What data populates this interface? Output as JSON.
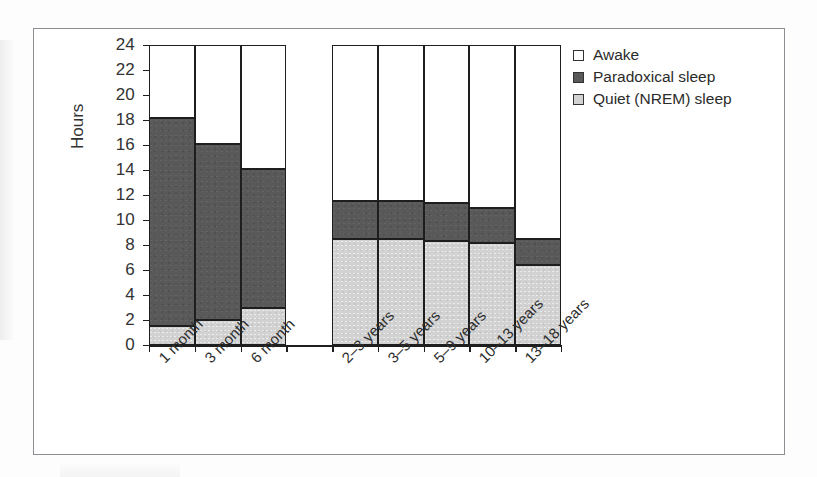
{
  "figure": {
    "background": "#ffffff",
    "frame_color": "#8d8d93"
  },
  "axis": {
    "y_title": "Hours",
    "y_ticks": [
      "0",
      "2",
      "4",
      "6",
      "8",
      "10",
      "12",
      "14",
      "16",
      "18",
      "20",
      "22",
      "24"
    ]
  },
  "legend": {
    "items": [
      {
        "label": "Awake",
        "color": "#ffffff",
        "swatch_name": "legend-swatch-awake"
      },
      {
        "label": "Paradoxical sleep",
        "color": "#595959",
        "swatch_name": "legend-swatch-paradoxical"
      },
      {
        "label": "Quiet (NREM) sleep",
        "color": "#d2d2d2",
        "swatch_name": "legend-swatch-quiet"
      }
    ]
  },
  "chart_data": {
    "type": "bar",
    "subtype": "stacked-bar",
    "title": "",
    "xlabel": "",
    "ylabel": "Hours",
    "ylim": [
      0,
      24
    ],
    "ytick_step": 2,
    "grid": false,
    "legend_position": "right-top",
    "categories": [
      "1 month",
      "3 month",
      "6 month",
      "2–3 years",
      "3–5 years",
      "5–9 years",
      "10–13 years",
      "13–18 years"
    ],
    "category_slots": [
      0,
      1,
      2,
      4,
      5,
      6,
      7,
      8
    ],
    "slot_count": 9,
    "gap_after_index": 2,
    "series": [
      {
        "name": "Quiet (NREM) sleep",
        "color": "#d2d2d2",
        "values": [
          1.5,
          2.0,
          3.0,
          8.5,
          8.5,
          8.3,
          8.2,
          6.4
        ]
      },
      {
        "name": "Paradoxical sleep",
        "color": "#595959",
        "values": [
          16.7,
          14.1,
          11.1,
          3.0,
          3.0,
          3.1,
          2.8,
          2.1
        ]
      },
      {
        "name": "Awake",
        "color": "#ffffff",
        "values": [
          5.8,
          7.9,
          9.9,
          12.5,
          12.5,
          12.6,
          13.0,
          15.5
        ]
      }
    ],
    "cumulative_tops": {
      "quiet": [
        1.5,
        2.0,
        3.0,
        8.5,
        8.5,
        8.3,
        8.2,
        6.4
      ],
      "paradoxical": [
        18.2,
        16.1,
        14.1,
        11.5,
        11.5,
        11.4,
        11.0,
        8.5
      ],
      "awake": [
        24,
        24,
        24,
        24,
        24,
        24,
        24,
        24
      ]
    }
  }
}
